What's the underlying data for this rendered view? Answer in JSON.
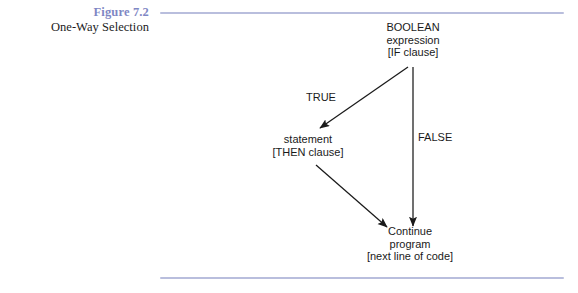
{
  "caption": {
    "figure_number": "Figure 7.2",
    "figure_title": "One-Way Selection",
    "number_color": "#7f87c4",
    "title_color": "#1c1c1c"
  },
  "rules": {
    "color": "#b9bedd",
    "top_label": "top-divider",
    "bottom_label": "bottom-divider"
  },
  "diagram": {
    "type": "flowchart",
    "nodes": [
      {
        "id": "boolean",
        "lines": [
          "BOOLEAN",
          "expression",
          "[IF clause]"
        ],
        "line1": "BOOLEAN",
        "line2": "expression",
        "line3": "[IF clause]"
      },
      {
        "id": "statement",
        "lines": [
          "statement",
          "[THEN clause]"
        ],
        "line1": "statement",
        "line2": "[THEN clause]"
      },
      {
        "id": "continue",
        "lines": [
          "Continue",
          "program",
          "[next line of code]"
        ],
        "line1": "Continue",
        "line2": "program",
        "line3": "[next line of code]"
      }
    ],
    "edges": [
      {
        "id": "true-edge",
        "label": "TRUE",
        "from": "boolean",
        "to": "statement"
      },
      {
        "id": "false-edge",
        "label": "FALSE",
        "from": "boolean",
        "to": "continue"
      },
      {
        "id": "then-edge",
        "label": "",
        "from": "statement",
        "to": "continue"
      }
    ],
    "edge_labels": {
      "true": "TRUE",
      "false": "FALSE"
    },
    "stroke_color": "#1a1a1a"
  }
}
